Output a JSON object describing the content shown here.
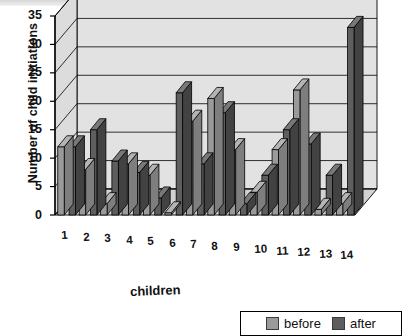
{
  "chart_data": {
    "type": "bar",
    "title": "",
    "xlabel": "children",
    "ylabel": "Number of child initiations",
    "categories": [
      "1",
      "2",
      "3",
      "4",
      "5",
      "6",
      "7",
      "8",
      "9",
      "10",
      "11",
      "12",
      "13",
      "14"
    ],
    "yticks": [
      0,
      5,
      10,
      15,
      20,
      25,
      30,
      35
    ],
    "ylim": [
      0,
      35
    ],
    "grid": true,
    "style": "3d-clustered-column",
    "legend_position": "bottom-right",
    "series": [
      {
        "name": "before",
        "color": "#9a9a9a",
        "values": [
          12,
          8,
          2,
          9,
          7,
          0.4,
          16.5,
          20.5,
          11.5,
          4,
          11.5,
          22,
          1,
          2
        ]
      },
      {
        "name": "after",
        "color": "#5e5e5e",
        "values": [
          12,
          15,
          9.5,
          7.5,
          3,
          21.5,
          9,
          18,
          2,
          7,
          15,
          12.5,
          7,
          33
        ]
      }
    ]
  },
  "legend": {
    "before_label": "before",
    "after_label": "after"
  },
  "colors": {
    "before": "#9a9a9a",
    "after": "#5e5e5e",
    "wall": "#e2e2e2",
    "floor": "#d2d2d2",
    "axis": "#000000"
  }
}
